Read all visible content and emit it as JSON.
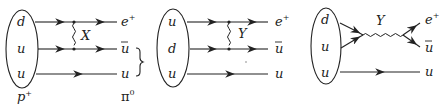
{
  "diagrams": [
    {
      "id": "panel-1",
      "initial_quarks": [
        "d",
        "u",
        "u"
      ],
      "boson": "X",
      "outgoing": [
        "e+",
        "ū",
        "u"
      ],
      "bottom_labels": {
        "initial": "p+",
        "final": "π0"
      },
      "topology": "exchange"
    },
    {
      "id": "panel-2",
      "initial_quarks": [
        "u",
        "d",
        "u"
      ],
      "boson": "Y",
      "outgoing": [
        "e+",
        "ū",
        "u"
      ],
      "topology": "exchange"
    },
    {
      "id": "panel-3",
      "initial_quarks": [
        "d",
        "u",
        "u"
      ],
      "boson": "Y",
      "outgoing": [
        "e+",
        "ū",
        "u"
      ],
      "topology": "annihilation"
    }
  ],
  "text": {
    "p1_q1": "d",
    "p1_q2": "u",
    "p1_q3": "u",
    "p1_boson": "X",
    "p1_out1": "e",
    "p1_out1_sup": "+",
    "p1_out2": "u",
    "p1_out3": "u",
    "p1_initial_base": "p",
    "p1_initial_sup": "+",
    "p1_final_base": "π",
    "p1_final_sup": "0",
    "p2_q1": "u",
    "p2_q2": "d",
    "p2_q3": "u",
    "p2_boson": "Y",
    "p2_out1": "e",
    "p2_out1_sup": "+",
    "p2_out2": "u",
    "p2_out3": "u",
    "p3_q1": "d",
    "p3_q2": "u",
    "p3_q3": "u",
    "p3_boson": "Y",
    "p3_out1": "e",
    "p3_out1_sup": "+",
    "p3_out2": "u",
    "p3_out3": "u"
  }
}
